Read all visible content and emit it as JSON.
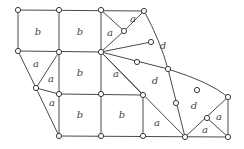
{
  "diagram": {
    "type": "mesh",
    "colors": {
      "stroke": "#4a4a4a",
      "node_fill": "#ffffff",
      "label": "#444444"
    },
    "nodes": [
      {
        "id": "n1",
        "x": 18,
        "y": 10
      },
      {
        "id": "n2",
        "x": 59,
        "y": 10
      },
      {
        "id": "n3",
        "x": 101,
        "y": 10
      },
      {
        "id": "n4",
        "x": 144,
        "y": 11
      },
      {
        "id": "n5",
        "x": 124,
        "y": 31
      },
      {
        "id": "n6",
        "x": 18,
        "y": 51
      },
      {
        "id": "n7",
        "x": 59,
        "y": 52
      },
      {
        "id": "n8",
        "x": 101,
        "y": 52
      },
      {
        "id": "n9",
        "x": 151,
        "y": 42
      },
      {
        "id": "n10",
        "x": 137,
        "y": 62
      },
      {
        "id": "n11",
        "x": 168,
        "y": 69
      },
      {
        "id": "n12",
        "x": 36,
        "y": 88
      },
      {
        "id": "n13",
        "x": 59,
        "y": 94
      },
      {
        "id": "n14",
        "x": 101,
        "y": 94
      },
      {
        "id": "n15",
        "x": 143,
        "y": 95
      },
      {
        "id": "n16",
        "x": 176,
        "y": 103
      },
      {
        "id": "n17",
        "x": 197,
        "y": 90
      },
      {
        "id": "n18",
        "x": 228,
        "y": 97
      },
      {
        "id": "n19",
        "x": 207,
        "y": 118
      },
      {
        "id": "n20",
        "x": 59,
        "y": 136
      },
      {
        "id": "n21",
        "x": 101,
        "y": 136
      },
      {
        "id": "n22",
        "x": 143,
        "y": 136
      },
      {
        "id": "n23",
        "x": 185,
        "y": 137
      },
      {
        "id": "n24",
        "x": 228,
        "y": 137
      }
    ],
    "labels": [
      {
        "text": "b",
        "x": 38,
        "y": 32
      },
      {
        "text": "b",
        "x": 80,
        "y": 32
      },
      {
        "text": "a",
        "x": 110,
        "y": 33
      },
      {
        "text": "a",
        "x": 133,
        "y": 19
      },
      {
        "text": "d",
        "x": 163,
        "y": 46
      },
      {
        "text": "a",
        "x": 36,
        "y": 64
      },
      {
        "text": "a",
        "x": 51,
        "y": 79
      },
      {
        "text": "b",
        "x": 80,
        "y": 73
      },
      {
        "text": "a",
        "x": 116,
        "y": 74
      },
      {
        "text": "d",
        "x": 155,
        "y": 81
      },
      {
        "text": "a",
        "x": 52,
        "y": 103
      },
      {
        "text": "b",
        "x": 80,
        "y": 115
      },
      {
        "text": "b",
        "x": 122,
        "y": 115
      },
      {
        "text": "a",
        "x": 157,
        "y": 123
      },
      {
        "text": "d",
        "x": 194,
        "y": 106
      },
      {
        "text": "a",
        "x": 219,
        "y": 117
      },
      {
        "text": "a",
        "x": 205,
        "y": 130
      }
    ]
  }
}
